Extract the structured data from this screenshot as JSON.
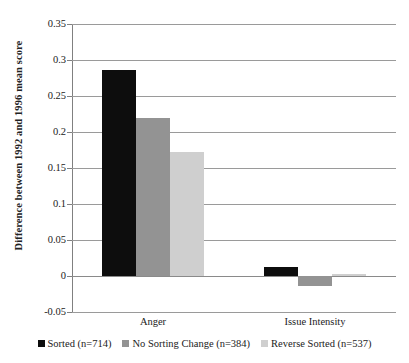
{
  "chart_data": {
    "type": "bar",
    "title": "",
    "subtitle": "",
    "xlabel": "",
    "ylabel": "Difference between 1992 and 1996 mean score",
    "categories": [
      "Anger",
      "Issue Intensity"
    ],
    "series": [
      {
        "name": "Sorted (n=714)",
        "color": "#0d0d0d",
        "values": [
          0.286,
          0.013
        ]
      },
      {
        "name": "No Sorting Change (n=384)",
        "color": "#939393",
        "values": [
          0.219,
          -0.014
        ]
      },
      {
        "name": "Reverse Sorted (n=537)",
        "color": "#cfcfcf",
        "values": [
          0.172,
          0.003
        ]
      }
    ],
    "ylim": [
      -0.05,
      0.35
    ],
    "ytick_labels": [
      "0.35",
      "0.3",
      "0.25",
      "0.2",
      "0.15",
      "0.1",
      "0.05",
      "0",
      "-0.05"
    ],
    "ytick_values": [
      0.35,
      0.3,
      0.25,
      0.2,
      0.15,
      0.1,
      0.05,
      0,
      -0.05
    ],
    "grid": true,
    "legend_position": "bottom"
  },
  "axis": {
    "y_title": "Difference between 1992 and 1996 mean score"
  },
  "legend": {
    "items": [
      {
        "label": "Sorted (n=714)"
      },
      {
        "label": "No Sorting Change (n=384)"
      },
      {
        "label": "Reverse Sorted (n=537)"
      }
    ]
  }
}
